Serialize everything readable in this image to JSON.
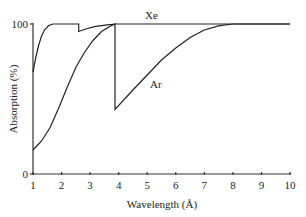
{
  "chart_data": {
    "type": "line",
    "title": "",
    "xlabel": "Wavelength (Å)",
    "ylabel": "Absorption (%)",
    "xlim": [
      1,
      10
    ],
    "ylim": [
      0,
      100
    ],
    "x_ticks": [
      "1",
      "2",
      "3",
      "4",
      "5",
      "6",
      "7",
      "8",
      "9",
      "10"
    ],
    "y_ticks": [
      "0",
      "100"
    ],
    "grid": false,
    "legend": "inline labels",
    "series": [
      {
        "name": "Xe",
        "points": [
          [
            1.0,
            68
          ],
          [
            1.1,
            78
          ],
          [
            1.2,
            86
          ],
          [
            1.3,
            92
          ],
          [
            1.4,
            96
          ],
          [
            1.55,
            99
          ],
          [
            1.7,
            100
          ],
          [
            2.6,
            100
          ],
          [
            2.6,
            95
          ],
          [
            2.9,
            97
          ],
          [
            3.2,
            98.5
          ],
          [
            3.6,
            99.5
          ],
          [
            3.9,
            100
          ],
          [
            10.0,
            100
          ]
        ]
      },
      {
        "name": "Ar",
        "points": [
          [
            1.0,
            16
          ],
          [
            1.3,
            22
          ],
          [
            1.6,
            31
          ],
          [
            1.9,
            44
          ],
          [
            2.2,
            58
          ],
          [
            2.5,
            71
          ],
          [
            2.8,
            81
          ],
          [
            3.1,
            89
          ],
          [
            3.4,
            95
          ],
          [
            3.7,
            98.5
          ],
          [
            3.87,
            100
          ],
          [
            3.87,
            43
          ],
          [
            4.5,
            56
          ],
          [
            5.0,
            66
          ],
          [
            5.5,
            76
          ],
          [
            6.0,
            84
          ],
          [
            6.5,
            91
          ],
          [
            7.0,
            96
          ],
          [
            7.5,
            98.8
          ],
          [
            8.0,
            100
          ],
          [
            10.0,
            100
          ]
        ]
      }
    ],
    "annotations": [
      {
        "text": "Xe",
        "x": 6.05,
        "y": 105
      },
      {
        "text": "Ar",
        "x": 6.25,
        "y": 59
      }
    ]
  },
  "labels": {
    "xlabel": "Wavelength (Å)",
    "ylabel": "Absorption (%)",
    "xe": "Xe",
    "ar": "Ar",
    "y0": "0",
    "y100": "100",
    "x": [
      "1",
      "2",
      "3",
      "4",
      "5",
      "6",
      "7",
      "8",
      "9",
      "10"
    ]
  }
}
